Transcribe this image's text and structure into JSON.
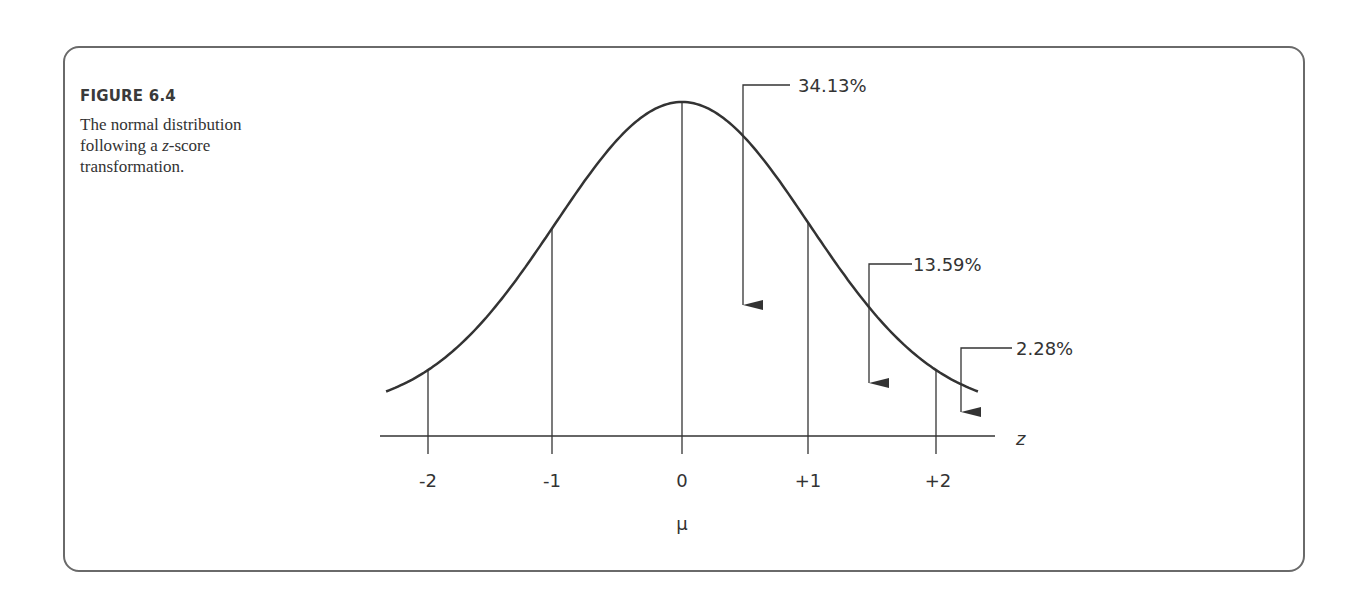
{
  "figure": {
    "label": "FIGURE 6.4",
    "caption_pre": "The normal distribution following a ",
    "caption_var": "z",
    "caption_post": "-score transformation."
  },
  "chart_data": {
    "type": "line",
    "title": "The normal distribution following a z-score transformation",
    "xlabel": "z",
    "ylabel": "",
    "x_ticks": [
      "-2",
      "-1",
      "0",
      "+1",
      "+2"
    ],
    "x_tick_values": [
      -2,
      -1,
      0,
      1,
      2
    ],
    "mean_label": "μ",
    "xlim": [
      -2.33,
      2.33
    ],
    "curve": "standard normal density",
    "annotations": [
      {
        "label": "34.13%",
        "region": "0 to +1"
      },
      {
        "label": "13.59%",
        "region": "+1 to +2"
      },
      {
        "label": "2.28%",
        "region": "beyond +2"
      }
    ],
    "grid": false,
    "legend": "none"
  }
}
